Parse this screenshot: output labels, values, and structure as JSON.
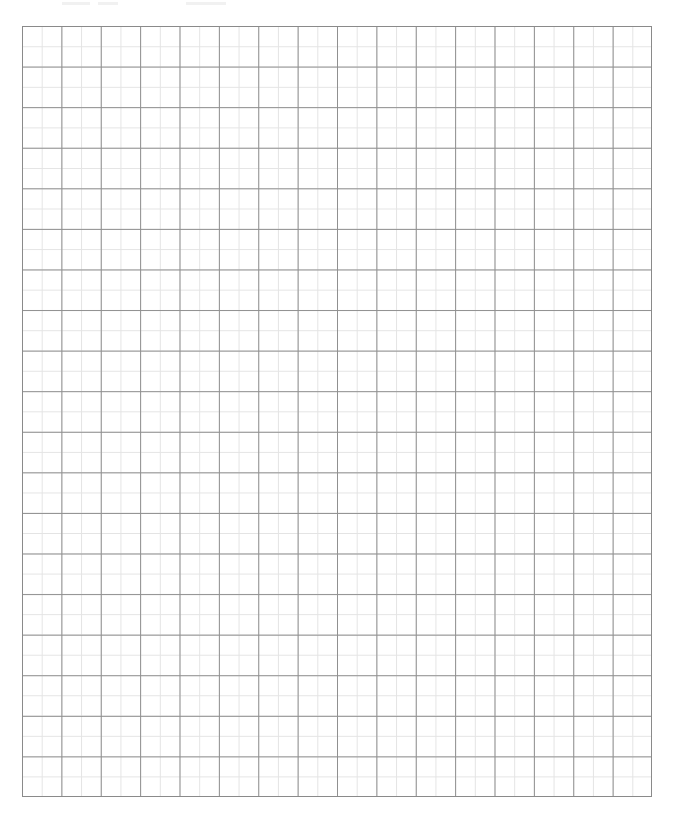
{
  "document": {
    "type": "graph-paper",
    "description": "Blank grid / graph paper sheet",
    "grid": {
      "major_columns": 16,
      "major_rows": 19,
      "minor_subdivisions_per_major": 2,
      "major_line_color": "#8f8f8f",
      "minor_line_color": "#e4e4e4",
      "border_color": "#8a8a8a",
      "background_color": "#ffffff"
    },
    "text": []
  }
}
